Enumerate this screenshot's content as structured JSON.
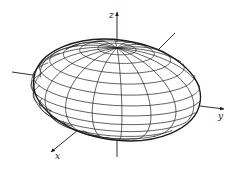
{
  "figure": {
    "type": "3d-ellipsoid-wireframe",
    "line_color": "#1a1a1a",
    "background": "#ffffff",
    "axes": {
      "x_label": "x",
      "y_label": "y",
      "z_label": "z"
    },
    "ellipsoid": {
      "center": [
        117,
        90
      ],
      "rx": 84,
      "ry": 50,
      "meridians": 18,
      "parallels": 14
    }
  }
}
